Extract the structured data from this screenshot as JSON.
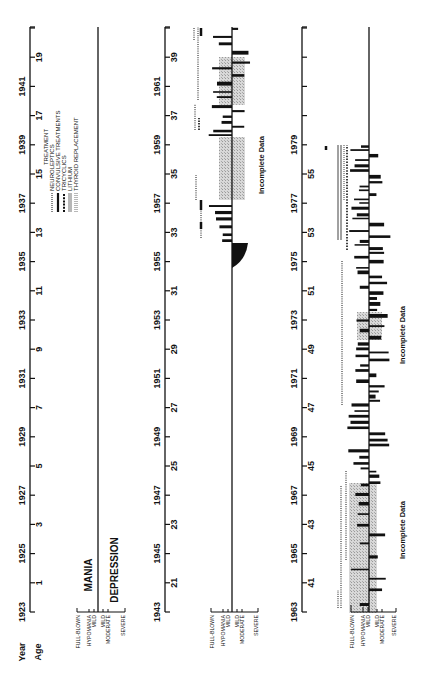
{
  "chart_data": {
    "type": "bar",
    "orientation": "rotated 90 degrees counter-clockwise; time runs bottom-to-top in three stacked panels",
    "axis_labels": {
      "year": "Year",
      "age": "Age"
    },
    "mood_labels": {
      "mania": "MANIA",
      "depression": "DEPRESSION"
    },
    "severity_scale": [
      "FULL-BLOWN",
      "HYPOMANIA",
      "MILD",
      "MILD",
      "MODERATE",
      "SEVERE"
    ],
    "severity_levels_mania": [
      "FULL-BLOWN",
      "HYPOMANIA",
      "MILD"
    ],
    "severity_levels_depression": [
      "MILD",
      "MODERATE",
      "SEVERE"
    ],
    "legend": {
      "title": "TREATMENT",
      "entries": [
        {
          "name": "NEUROLEPTICS",
          "style": "fine dotted line"
        },
        {
          "name": "CONVULSIVE TREATMENTS",
          "style": "thick solid bar"
        },
        {
          "name": "TRICYCLICS",
          "style": "heavy dotted squares"
        },
        {
          "name": "LITHIUM",
          "style": "double line"
        },
        {
          "name": "THYROID REPLACEMENT",
          "style": "dotted double line"
        }
      ]
    },
    "annotations": [
      "Incomplete Data",
      "Incomplete Data",
      "Incomplete Data"
    ],
    "panels": [
      {
        "years": [
          "1923",
          "1925",
          "1927",
          "1929",
          "1931",
          "1933",
          "1935",
          "1937",
          "1939",
          "1941"
        ],
        "ages": [
          "1",
          "3",
          "5",
          "7",
          "9",
          "11",
          "13",
          "15",
          "17",
          "19"
        ],
        "range": [
          1923,
          1942
        ],
        "episodes": "none"
      },
      {
        "years": [
          "1943",
          "1945",
          "1947",
          "1949",
          "1951",
          "1953",
          "1955",
          "1957",
          "1959",
          "1961"
        ],
        "ages": [
          "21",
          "23",
          "25",
          "27",
          "29",
          "31",
          "33",
          "35",
          "37",
          "39"
        ],
        "range": [
          1943,
          1962
        ],
        "episodes": "onset ~1954 with first severe depression, recurrent manic and depressive episodes 1955-1962; incomplete data ~1957-1958 and ~1960-1961"
      },
      {
        "years": [
          "1963",
          "1965",
          "1967",
          "1969",
          "1971",
          "1973",
          "1975",
          "1977",
          "1979"
        ],
        "ages": [
          "41",
          "43",
          "45",
          "47",
          "49",
          "51",
          "53",
          "55"
        ],
        "range": [
          1963,
          1982
        ],
        "episodes": "frequent rapid cycling 1963-1978; episodes cease ~1978; incomplete data ~1963-1967 and ~1972-1973"
      }
    ]
  },
  "labels": {
    "year": "Year",
    "age": "Age",
    "mania": "MANIA",
    "depression": "DEPRESSION",
    "legend_title": "TREATMENT",
    "legend_items": [
      "NEUROLEPTICS",
      "CONVULSIVE TREATMENTS",
      "TRICYCLICS",
      "LITHIUM",
      "THYROID REPLACEMENT"
    ],
    "severity": [
      "FULL-BLOWN",
      "HYPOMANIA",
      "MILD",
      "MILD",
      "MODERATE",
      "SEVERE"
    ],
    "incomplete": "Incomplete Data"
  },
  "panel1": {
    "years": [
      "1923",
      "1925",
      "1927",
      "1929",
      "1931",
      "1933",
      "1935",
      "1937",
      "1939",
      "1941"
    ],
    "ages": [
      "1",
      "3",
      "5",
      "7",
      "9",
      "11",
      "13",
      "15",
      "17",
      "19"
    ]
  },
  "panel2": {
    "years": [
      "1943",
      "1945",
      "1947",
      "1949",
      "1951",
      "1953",
      "1955",
      "1957",
      "1959",
      "1961"
    ],
    "ages": [
      "21",
      "23",
      "25",
      "27",
      "29",
      "31",
      "33",
      "35",
      "37",
      "39"
    ]
  },
  "panel3": {
    "years": [
      "1963",
      "1965",
      "1967",
      "1969",
      "1971",
      "1973",
      "1975",
      "1977",
      "1979"
    ],
    "ages": [
      "41",
      "43",
      "45",
      "47",
      "49",
      "51",
      "53",
      "55"
    ]
  }
}
